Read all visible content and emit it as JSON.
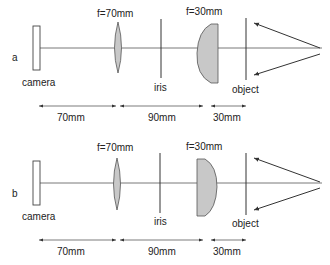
{
  "diagram": {
    "type": "optical-setup",
    "colors": {
      "line": "#333333",
      "lens_fill": "#c8c8c8",
      "background": "#ffffff"
    },
    "panels": [
      {
        "id": "a",
        "label": "a",
        "components": {
          "camera": "camera",
          "lens1": "f=70mm",
          "iris": "iris",
          "lens2": "f=30mm",
          "object": "object"
        },
        "lens2_orientation": "curved-side-left",
        "distances": [
          "70mm",
          "90mm",
          "30mm"
        ]
      },
      {
        "id": "b",
        "label": "b",
        "components": {
          "camera": "camera",
          "lens1": "f=70mm",
          "iris": "iris",
          "lens2": "f=30mm",
          "object": "object"
        },
        "lens2_orientation": "curved-side-right",
        "distances": [
          "70mm",
          "90mm",
          "30mm"
        ]
      }
    ]
  }
}
